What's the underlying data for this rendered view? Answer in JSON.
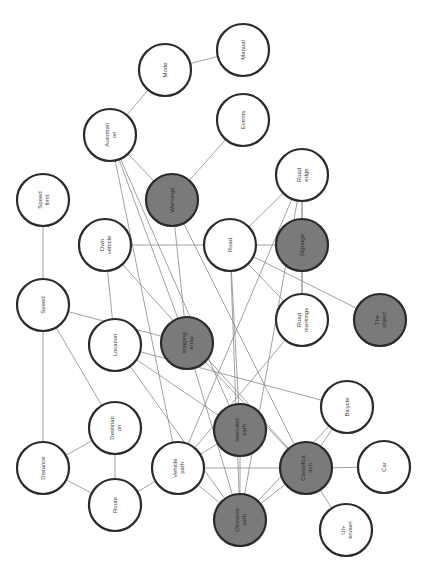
{
  "diagram": {
    "title": "",
    "orientation": "rotated-90-ccw",
    "colors": {
      "light_fill": "#ffffff",
      "dark_fill": "#7a7a7a",
      "stroke": "#2a2a2a",
      "edge": "#8a8a8a"
    },
    "nodes": [
      {
        "id": "mode",
        "label": "Mode",
        "lines": [
          "Mode"
        ],
        "x": 165,
        "y": 70,
        "dark": false
      },
      {
        "id": "manual",
        "label": "Manual",
        "lines": [
          "Manual"
        ],
        "x": 243,
        "y": 50,
        "dark": false
      },
      {
        "id": "automation",
        "label": "Automation",
        "lines": [
          "Automati",
          "on"
        ],
        "x": 110,
        "y": 135,
        "dark": false
      },
      {
        "id": "events",
        "label": "Events",
        "lines": [
          "Events"
        ],
        "x": 243,
        "y": 120,
        "dark": false
      },
      {
        "id": "warnings",
        "label": "Warnings",
        "lines": [
          "Warnings"
        ],
        "x": 172,
        "y": 200,
        "dark": true
      },
      {
        "id": "road_edge",
        "label": "Road edge",
        "lines": [
          "Road",
          "edge"
        ],
        "x": 302,
        "y": 175,
        "dark": false
      },
      {
        "id": "speed_limit",
        "label": "Speed limit",
        "lines": [
          "Speed",
          "limit"
        ],
        "x": 43,
        "y": 200,
        "dark": false
      },
      {
        "id": "own_vehicle",
        "label": "Own vehicle",
        "lines": [
          "Own",
          "vehicle"
        ],
        "x": 105,
        "y": 245,
        "dark": false
      },
      {
        "id": "road",
        "label": "Road",
        "lines": [
          "Road"
        ],
        "x": 230,
        "y": 245,
        "dark": false
      },
      {
        "id": "signage",
        "label": "Signage",
        "lines": [
          "Signage"
        ],
        "x": 302,
        "y": 245,
        "dark": true
      },
      {
        "id": "speed",
        "label": "Speed",
        "lines": [
          "Speed"
        ],
        "x": 43,
        "y": 305,
        "dark": false
      },
      {
        "id": "location",
        "label": "Location",
        "lines": [
          "Location"
        ],
        "x": 115,
        "y": 345,
        "dark": false
      },
      {
        "id": "imaging_array",
        "label": "Imaging array",
        "lines": [
          "Imaging",
          "array"
        ],
        "x": 187,
        "y": 343,
        "dark": true
      },
      {
        "id": "road_markings",
        "label": "Road markings",
        "lines": [
          "Road",
          "markings"
        ],
        "x": 302,
        "y": 320,
        "dark": false
      },
      {
        "id": "the_object",
        "label": "The object",
        "lines": [
          "The",
          "object"
        ],
        "x": 380,
        "y": 320,
        "dark": true
      },
      {
        "id": "destination",
        "label": "Destination",
        "lines": [
          "Destinati",
          "on"
        ],
        "x": 115,
        "y": 428,
        "dark": false
      },
      {
        "id": "intended_path",
        "label": "Intended path",
        "lines": [
          "Intended",
          "path"
        ],
        "x": 240,
        "y": 430,
        "dark": true
      },
      {
        "id": "bicycle",
        "label": "Bicycle",
        "lines": [
          "Bicycle"
        ],
        "x": 347,
        "y": 407,
        "dark": false
      },
      {
        "id": "distance",
        "label": "Distance",
        "lines": [
          "Distance"
        ],
        "x": 43,
        "y": 468,
        "dark": false
      },
      {
        "id": "vehicle_path",
        "label": "Vehicle path",
        "lines": [
          "Vehicle",
          "path"
        ],
        "x": 178,
        "y": 468,
        "dark": false
      },
      {
        "id": "classification",
        "label": "Classification",
        "lines": [
          "Classifica",
          "tion"
        ],
        "x": 306,
        "y": 468,
        "dark": true
      },
      {
        "id": "car",
        "label": "Car",
        "lines": [
          "Car"
        ],
        "x": 384,
        "y": 467,
        "dark": false
      },
      {
        "id": "route",
        "label": "Route",
        "lines": [
          "Route"
        ],
        "x": 115,
        "y": 505,
        "dark": false
      },
      {
        "id": "obstacle_path",
        "label": "Obstacle path",
        "lines": [
          "Obstacle",
          "path"
        ],
        "x": 240,
        "y": 520,
        "dark": true
      },
      {
        "id": "unknown",
        "label": "Unknown",
        "lines": [
          "Un-",
          "known"
        ],
        "x": 346,
        "y": 530,
        "dark": false
      }
    ],
    "edges": [
      [
        "mode",
        "manual"
      ],
      [
        "mode",
        "automation"
      ],
      [
        "automation",
        "warnings"
      ],
      [
        "automation",
        "imaging_array"
      ],
      [
        "automation",
        "intended_path"
      ],
      [
        "automation",
        "vehicle_path"
      ],
      [
        "events",
        "warnings"
      ],
      [
        "warnings",
        "imaging_array"
      ],
      [
        "warnings",
        "classification"
      ],
      [
        "road_edge",
        "road"
      ],
      [
        "road_edge",
        "signage"
      ],
      [
        "road_edge",
        "vehicle_path"
      ],
      [
        "road_edge",
        "obstacle_path"
      ],
      [
        "road_edge",
        "road_markings"
      ],
      [
        "speed_limit",
        "speed"
      ],
      [
        "speed",
        "distance"
      ],
      [
        "speed",
        "imaging_array"
      ],
      [
        "speed",
        "destination"
      ],
      [
        "own_vehicle",
        "road"
      ],
      [
        "own_vehicle",
        "location"
      ],
      [
        "own_vehicle",
        "classification"
      ],
      [
        "road",
        "signage"
      ],
      [
        "road",
        "road_markings"
      ],
      [
        "road",
        "the_object"
      ],
      [
        "road",
        "intended_path"
      ],
      [
        "road",
        "obstacle_path"
      ],
      [
        "signage",
        "road_markings"
      ],
      [
        "road_markings",
        "vehicle_path"
      ],
      [
        "location",
        "intended_path"
      ],
      [
        "location",
        "bicycle"
      ],
      [
        "location",
        "obstacle_path"
      ],
      [
        "imaging_array",
        "classification"
      ],
      [
        "imaging_array",
        "obstacle_path"
      ],
      [
        "destination",
        "distance"
      ],
      [
        "destination",
        "route"
      ],
      [
        "intended_path",
        "obstacle_path"
      ],
      [
        "intended_path",
        "vehicle_path"
      ],
      [
        "bicycle",
        "classification"
      ],
      [
        "bicycle",
        "obstacle_path"
      ],
      [
        "distance",
        "route"
      ],
      [
        "route",
        "vehicle_path"
      ],
      [
        "vehicle_path",
        "obstacle_path"
      ],
      [
        "vehicle_path",
        "classification"
      ],
      [
        "classification",
        "car"
      ],
      [
        "classification",
        "unknown"
      ],
      [
        "classification",
        "obstacle_path"
      ]
    ]
  }
}
